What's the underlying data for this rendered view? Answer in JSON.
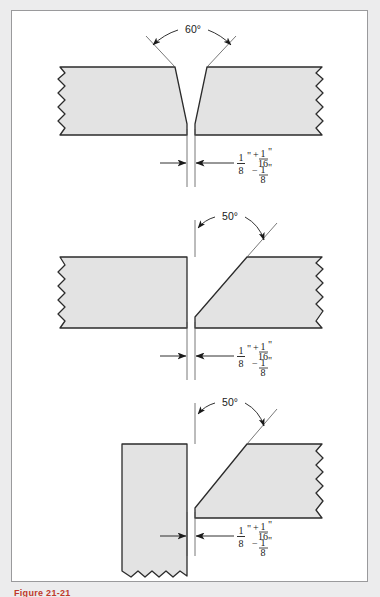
{
  "page": {
    "background_color": "#ececed",
    "frame_background": "#ffffff",
    "frame_border_color": "#9a9a9c",
    "plate_fill": "#e3e3e3",
    "line_color": "#2b2b2b",
    "caption_color": "#c0392b"
  },
  "caption": {
    "text": "Figure 21-21"
  },
  "figures": [
    {
      "id": "figure-1",
      "joint_name": "double-bevel-vee-groove-butt-joint",
      "angle": {
        "value": "60",
        "unit": "°",
        "label": "60°"
      },
      "root_opening": {
        "value_whole": "",
        "numerator": "1",
        "denominator": "8",
        "unit": "\"",
        "plus_sign": "+",
        "plus_numerator": "1",
        "plus_denominator": "16",
        "plus_unit": "\"",
        "minus_sign": "−",
        "minus_numerator": "1",
        "minus_denominator": "8",
        "minus_unit": "\""
      }
    },
    {
      "id": "figure-2",
      "joint_name": "single-bevel-groove-butt-joint",
      "angle": {
        "value": "50",
        "unit": "°",
        "label": "50°"
      },
      "root_opening": {
        "numerator": "1",
        "denominator": "8",
        "unit": "\"",
        "plus_sign": "+",
        "plus_numerator": "1",
        "plus_denominator": "16",
        "plus_unit": "\"",
        "minus_sign": "−",
        "minus_numerator": "1",
        "minus_denominator": "8",
        "minus_unit": "\""
      }
    },
    {
      "id": "figure-3",
      "joint_name": "single-bevel-groove-tee-joint",
      "angle": {
        "value": "50",
        "unit": "°",
        "label": "50°"
      },
      "root_opening": {
        "numerator": "1",
        "denominator": "8",
        "unit": "\"",
        "plus_sign": "+",
        "plus_numerator": "1",
        "plus_denominator": "16",
        "plus_unit": "\"",
        "minus_sign": "−",
        "minus_numerator": "1",
        "minus_denominator": "8",
        "minus_unit": "\""
      }
    }
  ]
}
